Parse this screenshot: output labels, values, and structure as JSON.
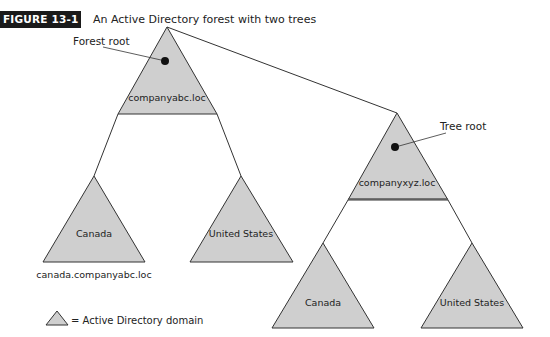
{
  "figure": {
    "label": "FIGURE 13-1",
    "caption": "An Active Directory forest with two trees"
  },
  "colors": {
    "domain_fill": "#cfcfcf",
    "stroke": "#333333",
    "badge_bg": "#1a1a1a"
  },
  "trees": [
    {
      "root_label": "companyabc.loc",
      "callout": "Forest root",
      "children": [
        {
          "label": "Canada",
          "fqdn": "canada.companyabc.loc"
        },
        {
          "label": "United States"
        }
      ]
    },
    {
      "root_label": "companyxyz.loc",
      "callout": "Tree root",
      "children": [
        {
          "label": "Canada"
        },
        {
          "label": "United States"
        }
      ]
    }
  ],
  "legend": {
    "text": "= Active Directory domain"
  }
}
